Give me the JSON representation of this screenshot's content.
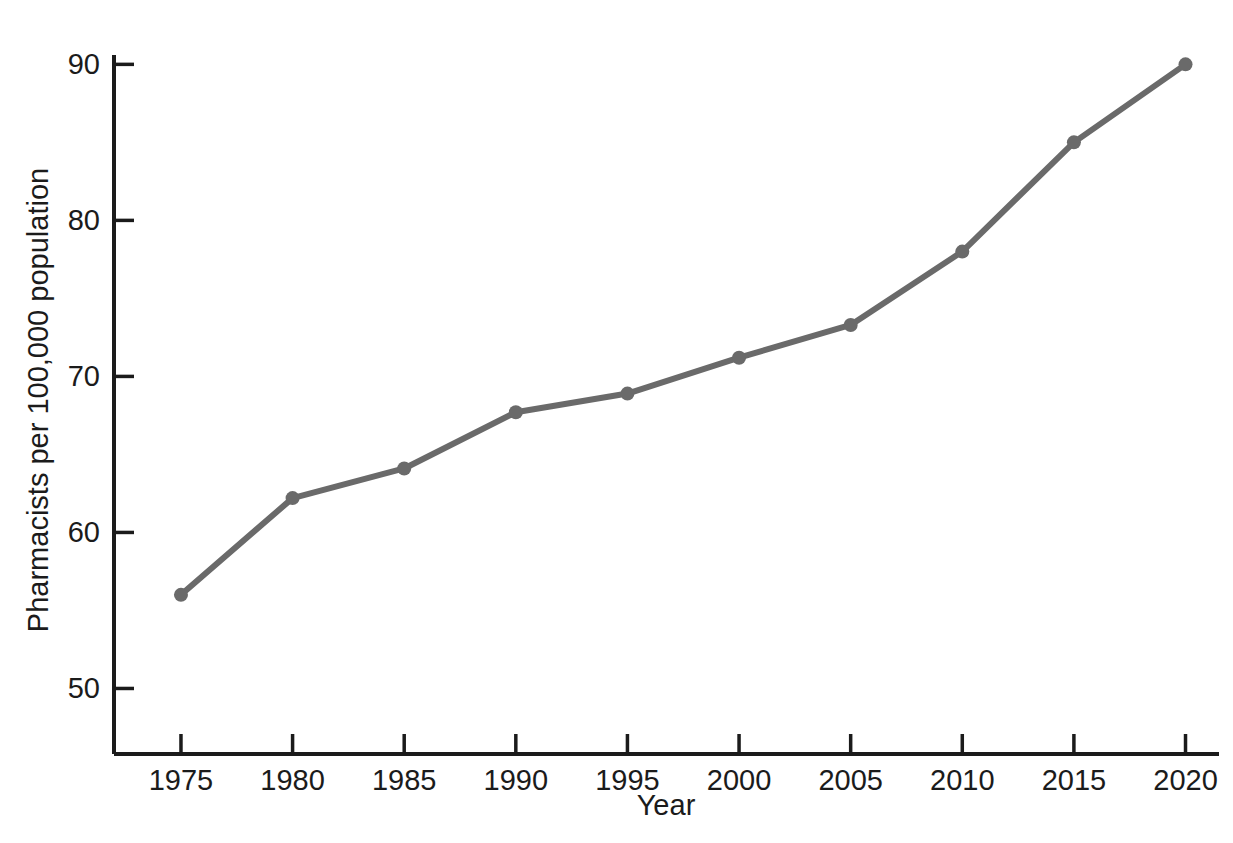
{
  "chart_data": {
    "type": "line",
    "title": "",
    "subtitle": "",
    "xlabel": "Year",
    "ylabel": "Pharmacists per 100,000 population",
    "x": [
      1975,
      1980,
      1985,
      1990,
      1995,
      2000,
      2005,
      2010,
      2015,
      2020
    ],
    "categories": [
      "1975",
      "1980",
      "1985",
      "1990",
      "1995",
      "2000",
      "2005",
      "2010",
      "2015",
      "2020"
    ],
    "values": [
      56.0,
      62.2,
      64.1,
      67.7,
      68.9,
      71.2,
      73.3,
      78.0,
      85.0,
      90.0
    ],
    "series": [
      {
        "name": "Pharmacists per 100,000 population",
        "values": [
          56.0,
          62.2,
          64.1,
          67.7,
          68.9,
          71.2,
          73.3,
          78.0,
          85.0,
          90.0
        ],
        "color": "#6a6a6a",
        "marker": "circle",
        "line_width": 6,
        "marker_size": 14
      }
    ],
    "xlim": [
      1972.0,
      2021.5
    ],
    "ylim": [
      45.8,
      90.6
    ],
    "xticks": [
      1975,
      1980,
      1985,
      1990,
      1995,
      2000,
      2005,
      2010,
      2015,
      2020
    ],
    "xtick_labels": [
      "1975",
      "1980",
      "1985",
      "1990",
      "1995",
      "2000",
      "2005",
      "2010",
      "2015",
      "2020"
    ],
    "yticks": [
      50,
      60,
      70,
      80,
      90
    ],
    "ytick_labels": [
      "50",
      "60",
      "70",
      "80",
      "90"
    ],
    "grid": false,
    "legend": false,
    "legend_position": "none",
    "tick_direction": "in",
    "axis_color": "#1b1b1b",
    "background_color": "#ffffff",
    "annotations": []
  }
}
